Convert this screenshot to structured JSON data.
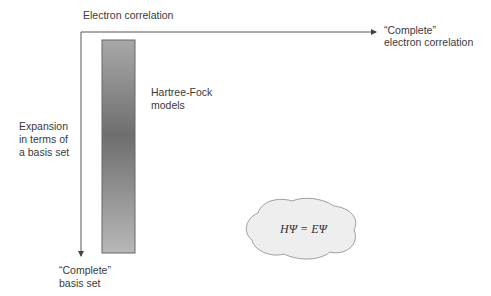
{
  "diagram": {
    "x_axis": {
      "label": "Electron correlation",
      "end_label_line1": "“Complete”",
      "end_label_line2": "electron correlation"
    },
    "y_axis": {
      "label_line1": "Expansion",
      "label_line2": "in terms of",
      "label_line3": "a basis set",
      "end_label_line1": "“Complete”",
      "end_label_line2": "basis set"
    },
    "hf_bar": {
      "label_line1": "Hartree-Fock",
      "label_line2": "models"
    },
    "cloud": {
      "equation": "HΨ = EΨ"
    },
    "colors": {
      "axis": "#555555",
      "bar_light": "#b5b5b5",
      "bar_dark": "#707070",
      "cloud_fill": "#eeeeee",
      "cloud_stroke": "#888888"
    }
  }
}
